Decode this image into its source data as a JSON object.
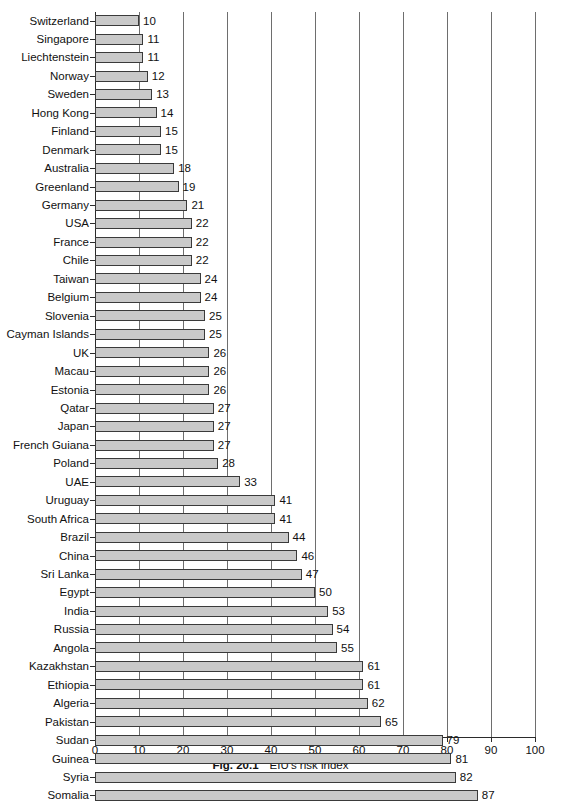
{
  "caption": {
    "figure_number": "Fig. 20.1",
    "text": "EIU's risk index"
  },
  "chart_data": {
    "type": "bar",
    "orientation": "horizontal",
    "title": "EIU's risk index",
    "xlabel": "",
    "ylabel": "",
    "xlim": [
      0,
      100
    ],
    "xticks": [
      0,
      10,
      20,
      30,
      40,
      50,
      60,
      70,
      80,
      90,
      100
    ],
    "grid": "vertical gridlines at every major x tick",
    "legend": "none",
    "bar_color": "#c9c9c9",
    "bar_border_color": "#3a3a3a",
    "value_labels": true,
    "categories": [
      "Switzerland",
      "Singapore",
      "Liechtenstein",
      "Norway",
      "Sweden",
      "Hong Kong",
      "Finland",
      "Denmark",
      "Australia",
      "Greenland",
      "Germany",
      "USA",
      "France",
      "Chile",
      "Taiwan",
      "Belgium",
      "Slovenia",
      "Cayman Islands",
      "UK",
      "Macau",
      "Estonia",
      "Qatar",
      "Japan",
      "French Guiana",
      "Poland",
      "UAE",
      "Uruguay",
      "South Africa",
      "Brazil",
      "China",
      "Sri Lanka",
      "Egypt",
      "India",
      "Russia",
      "Angola",
      "Kazakhstan",
      "Ethiopia",
      "Algeria",
      "Pakistan",
      "Sudan",
      "Guinea",
      "Syria",
      "Somalia"
    ],
    "values": [
      10,
      11,
      11,
      12,
      13,
      14,
      15,
      15,
      18,
      19,
      21,
      22,
      22,
      22,
      24,
      24,
      25,
      25,
      26,
      26,
      26,
      27,
      27,
      27,
      28,
      33,
      41,
      41,
      44,
      46,
      47,
      50,
      53,
      54,
      55,
      61,
      61,
      62,
      65,
      79,
      81,
      82,
      87
    ]
  }
}
